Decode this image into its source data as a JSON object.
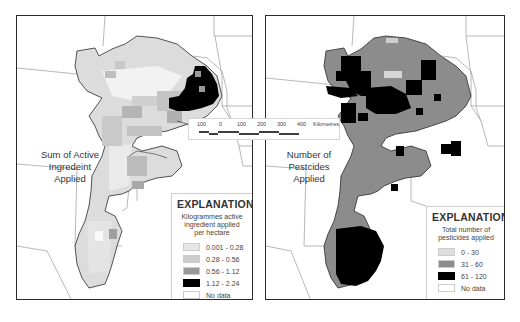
{
  "header": {
    "title_fragment": ""
  },
  "scale_bar": {
    "ticks": [
      "100",
      "0",
      "100",
      "200",
      "300",
      "400"
    ],
    "unit": "Kilometres"
  },
  "left_map": {
    "label_lines": [
      "Sum of Active",
      "Ingredeint",
      "Applied"
    ],
    "legend": {
      "title": "EXPLANATION",
      "subtitle_lines": [
        "Kilogrammes active",
        "ingredient applied",
        "per hectare"
      ],
      "items": [
        {
          "label": "0.001 - 0.28",
          "color": "#e6e6e6"
        },
        {
          "label": "0.28 - 0.56",
          "color": "#cccccc"
        },
        {
          "label": "0.56 - 1.12",
          "color": "#999999"
        },
        {
          "label": "1.12 - 2.24",
          "color": "#000000"
        },
        {
          "label": "No data",
          "color": "#ffffff"
        }
      ]
    }
  },
  "right_map": {
    "label_lines": [
      "Number of",
      "Pestcides",
      "Applied"
    ],
    "legend": {
      "title": "EXPLANATION",
      "subtitle_lines": [
        "Total number of",
        "pesticides applied"
      ],
      "items": [
        {
          "label": "0 - 30",
          "color": "#dddddd"
        },
        {
          "label": "31 - 60",
          "color": "#8c8c8c"
        },
        {
          "label": "61 - 120",
          "color": "#000000"
        },
        {
          "label": "No data",
          "color": "#ffffff"
        }
      ]
    }
  }
}
